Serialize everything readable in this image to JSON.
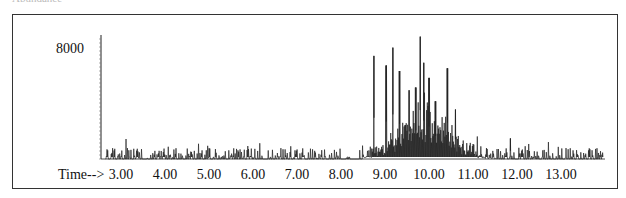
{
  "caption": "Abundance",
  "time_label": "Time-->",
  "chart_data": {
    "type": "line",
    "title": "",
    "xlabel": "Time-->",
    "ylabel": "Abundance",
    "y_tick_labels": [
      "8000"
    ],
    "y_ticks": [
      8000
    ],
    "x_tick_labels": [
      "3.00",
      "4.00",
      "5.00",
      "6.00",
      "7.00",
      "8.00",
      "9.00",
      "10.00",
      "11.00",
      "12.00",
      "13.00"
    ],
    "x_ticks": [
      3,
      4,
      5,
      6,
      7,
      8,
      9,
      10,
      11,
      12,
      13
    ],
    "xlim": [
      2.55,
      14.0
    ],
    "ylim": [
      0,
      9000
    ],
    "grid": false,
    "legend": null,
    "major_peaks": [
      {
        "time": 8.75,
        "abundance": 7500
      },
      {
        "time": 9.03,
        "abundance": 6800
      },
      {
        "time": 9.18,
        "abundance": 8100
      },
      {
        "time": 9.33,
        "abundance": 6400
      },
      {
        "time": 9.55,
        "abundance": 5000
      },
      {
        "time": 9.7,
        "abundance": 5200
      },
      {
        "time": 9.8,
        "abundance": 8900
      },
      {
        "time": 9.88,
        "abundance": 7000
      },
      {
        "time": 10.0,
        "abundance": 5900
      },
      {
        "time": 10.15,
        "abundance": 4200
      },
      {
        "time": 10.42,
        "abundance": 6600
      },
      {
        "time": 10.6,
        "abundance": 3600
      },
      {
        "time": 11.85,
        "abundance": 1500
      }
    ],
    "baseline_noise_level": 800
  },
  "colors": {
    "trace": "#222222",
    "frame": "#333333"
  }
}
